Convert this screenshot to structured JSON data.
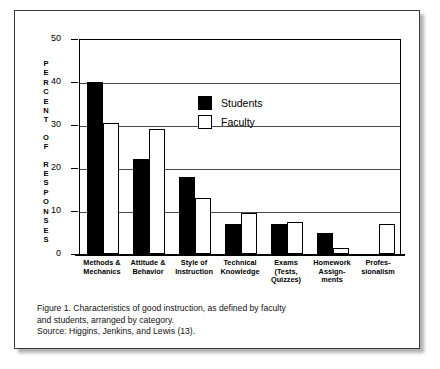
{
  "figure": {
    "y_axis_title": "PERCENT OF RESPONSES",
    "caption_line_1": "Figure 1. Characteristics of good instruction, as defined by faculty",
    "caption_line_2": "and students, arranged by category.",
    "caption_line_3": "Source: Higgins, Jenkins, and Lewis (13).",
    "colors": {
      "students": "#000000",
      "faculty": "#ffffff",
      "axis": "#000000",
      "gridline": "#4a4a4a",
      "frame": "#3a3a3a"
    }
  },
  "chart_data": {
    "type": "bar",
    "title": "",
    "xlabel": "",
    "ylabel": "PERCENT OF RESPONSES",
    "ylim": [
      0,
      50
    ],
    "yticks": [
      0,
      10,
      20,
      30,
      40,
      50
    ],
    "ytick_labels": [
      "0",
      "10",
      "20",
      "30",
      "40",
      "50"
    ],
    "grid": true,
    "legend_position": "upper-left-inside",
    "categories": [
      "Methods & Mechanics",
      "Attitude & Behavior",
      "Style of Instruction",
      "Technical Knowledge",
      "Exams (Tests, Quizzes)",
      "Homework Assignments",
      "Professionalism"
    ],
    "category_label_lines": [
      [
        "Methods &",
        "Mechanics"
      ],
      [
        "Attitude &",
        "Behavior"
      ],
      [
        "Style of",
        "Instruction"
      ],
      [
        "Technical",
        "Knowledge"
      ],
      [
        "Exams",
        "(Tests,",
        "Quizzes)"
      ],
      [
        "Homework",
        "Assign-",
        "ments"
      ],
      [
        "Profes-",
        "sionalism"
      ]
    ],
    "series": [
      {
        "name": "Students",
        "color": "#000000",
        "values": [
          40,
          22,
          18,
          7,
          7,
          5,
          0
        ]
      },
      {
        "name": "Faculty",
        "color": "#ffffff",
        "values": [
          30.5,
          29,
          13,
          9.5,
          7.5,
          1.3,
          7
        ]
      }
    ]
  },
  "legend": {
    "items": [
      {
        "label": "Students",
        "swatch": "filled-black"
      },
      {
        "label": "Faculty",
        "swatch": "outlined-white"
      }
    ]
  }
}
